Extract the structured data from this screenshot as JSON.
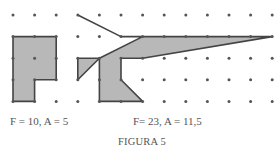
{
  "figure": {
    "title": "FIGURA 5",
    "grid": {
      "cols": 13,
      "rows": 5,
      "dot_color": "#555555"
    },
    "shapes": [
      {
        "name": "shape-left",
        "caption": "F = 10, A = 5",
        "fill": "#b8b8b8",
        "stroke": "#444444",
        "points": [
          [
            0,
            1
          ],
          [
            2,
            1
          ],
          [
            2,
            3
          ],
          [
            1,
            3
          ],
          [
            1,
            4
          ],
          [
            0,
            4
          ]
        ]
      },
      {
        "name": "shape-right",
        "caption": "F= 23, A = 11,5",
        "fill": "#b8b8b8",
        "stroke": "#444444",
        "points": [
          [
            3,
            0
          ],
          [
            5,
            1
          ],
          [
            12,
            1
          ],
          [
            6,
            2
          ],
          [
            5,
            2
          ],
          [
            5,
            3
          ],
          [
            6,
            4
          ],
          [
            5,
            4
          ],
          [
            4,
            4
          ],
          [
            4,
            2
          ],
          [
            3,
            3
          ],
          [
            3,
            2
          ],
          [
            4,
            2
          ],
          [
            6,
            1
          ]
        ]
      }
    ]
  }
}
